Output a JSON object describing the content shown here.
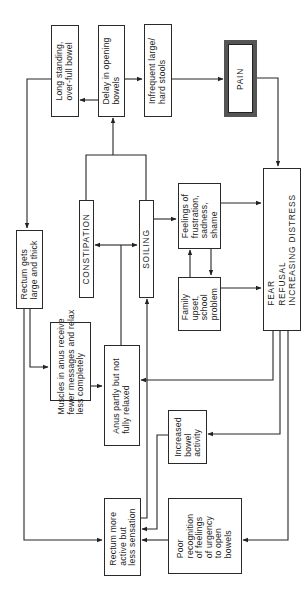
{
  "diagram": {
    "type": "flowchart",
    "orientation": "rotated-90-ccw",
    "nodes": [
      {
        "id": "long_standing",
        "label": "Long standing,\nover-full bowel"
      },
      {
        "id": "delay",
        "label": "Delay in opening\nbowels"
      },
      {
        "id": "infrequent",
        "label": "Infrequent large/\nhard stools"
      },
      {
        "id": "pain",
        "label": "PAIN"
      },
      {
        "id": "rectum_large",
        "label": "Rectum gets\nlarge and thick"
      },
      {
        "id": "constipation",
        "label": "CONSTIPATION"
      },
      {
        "id": "soiling",
        "label": "SOILING"
      },
      {
        "id": "feelings",
        "label": "Feelings of\nfrustration,\nsadness,\nshame"
      },
      {
        "id": "family",
        "label": "Family\nupset,\nschool\nproblem"
      },
      {
        "id": "fear",
        "label": "FEAR\nREFUSAL\nINCREASING DISTRESS"
      },
      {
        "id": "muscles",
        "label": "Muscles in anus receive\nfewer messages and relax\nless completely"
      },
      {
        "id": "anus",
        "label": "Anus partly but not\nfully relaxed"
      },
      {
        "id": "increased",
        "label": "Increased\nbowel\nactivity"
      },
      {
        "id": "rectum_active",
        "label": "Rectum more\nactive but\nless sensation"
      },
      {
        "id": "poor",
        "label": "Poor\nrecognition\nof feelings\nof urgency\nto open\nbowels"
      }
    ],
    "edges": [
      {
        "from": "constipation",
        "to": "delay"
      },
      {
        "from": "soiling",
        "to": "delay"
      },
      {
        "from": "delay",
        "to": "long_standing"
      },
      {
        "from": "delay",
        "to": "infrequent"
      },
      {
        "from": "infrequent",
        "to": "pain"
      },
      {
        "from": "pain",
        "to": "fear"
      },
      {
        "from": "long_standing",
        "to": "rectum_large"
      },
      {
        "from": "anus",
        "to": "constipation"
      },
      {
        "from": "anus",
        "to": "soiling"
      },
      {
        "from": "soiling",
        "to": "feelings"
      },
      {
        "from": "feelings",
        "to": "family"
      },
      {
        "from": "family",
        "to": "feelings"
      },
      {
        "from": "feelings",
        "to": "fear"
      },
      {
        "from": "family",
        "to": "fear"
      },
      {
        "from": "rectum_large",
        "to": "muscles"
      },
      {
        "from": "muscles",
        "to": "anus"
      },
      {
        "from": "rectum_large",
        "to": "rectum_active"
      },
      {
        "from": "rectum_active",
        "to": "soiling"
      },
      {
        "from": "fear",
        "to": "anus"
      },
      {
        "from": "fear",
        "to": "increased"
      },
      {
        "from": "fear",
        "to": "poor"
      },
      {
        "from": "increased",
        "to": "rectum_active"
      },
      {
        "from": "poor",
        "to": "rectum_active"
      }
    ]
  }
}
